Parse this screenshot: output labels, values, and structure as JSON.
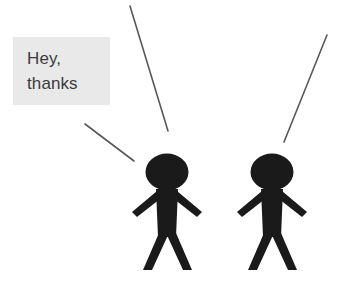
{
  "canvas": {
    "width": 354,
    "height": 283,
    "background": "#ffffff"
  },
  "callout": {
    "name": "speech-callout",
    "line1": "Hey,",
    "line2": "thanks",
    "background": "#e9e9e9",
    "text_color": "#3b3b3b",
    "x": 13,
    "y": 37,
    "width": 97,
    "height": 68
  },
  "leader_lines": [
    {
      "name": "callout-leader-line",
      "x1": 85,
      "y1": 124,
      "x2": 134,
      "y2": 161,
      "color": "#585858",
      "width": 1.6
    },
    {
      "name": "pointer-line-center",
      "x1": 130,
      "y1": 6,
      "x2": 168,
      "y2": 131,
      "color": "#585858",
      "width": 1.6
    },
    {
      "name": "pointer-line-right",
      "x1": 327,
      "y1": 35,
      "x2": 284,
      "y2": 142,
      "color": "#585858",
      "width": 1.6
    }
  ],
  "figures": [
    {
      "name": "stick-figure-left",
      "label": "left person",
      "color": "#1a1a1a",
      "center_x": 167,
      "head": {
        "cx": 167,
        "cy": 172,
        "rx": 21,
        "ry": 18
      },
      "body_top": 190,
      "body_bottom": 270
    },
    {
      "name": "stick-figure-right",
      "label": "right person",
      "color": "#1a1a1a",
      "center_x": 272,
      "head": {
        "cx": 272,
        "cy": 172,
        "rx": 21,
        "ry": 18
      },
      "body_top": 190,
      "body_bottom": 270
    }
  ]
}
